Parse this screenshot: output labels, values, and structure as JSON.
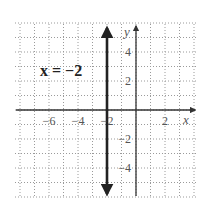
{
  "chart_data": {
    "type": "line",
    "title": "",
    "equation_label": "x = −2",
    "xlabel": "x",
    "ylabel": "y",
    "xlim": [
      -8.5,
      4
    ],
    "ylim": [
      -6,
      6
    ],
    "grid": true,
    "grid_style": "dotted",
    "x_ticks": [
      -6,
      -4,
      -2,
      2
    ],
    "x_tick_labels": [
      "−6",
      "−4",
      "−2",
      "2"
    ],
    "y_ticks": [
      4,
      2,
      -2,
      -4
    ],
    "y_tick_labels": [
      "4",
      "2",
      "−2",
      "−4"
    ],
    "series": [
      {
        "name": "x = −2",
        "kind": "vertical_line",
        "x": [
          -2,
          -2
        ],
        "y": [
          -6,
          6
        ],
        "arrows": "both",
        "color": "#222222"
      }
    ]
  },
  "colors": {
    "line": "#222222",
    "axis": "#333333",
    "grid": "#9a9a9a",
    "text": "#555555"
  }
}
